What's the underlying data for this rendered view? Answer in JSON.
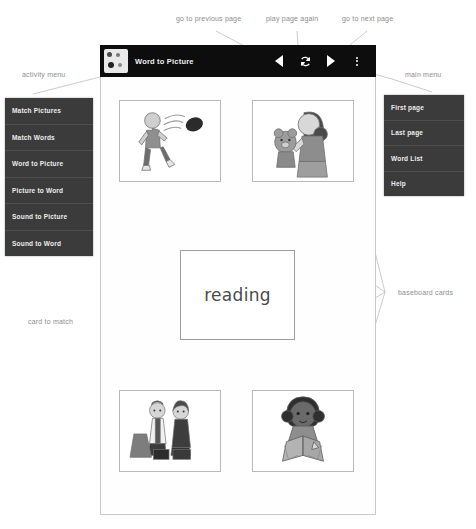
{
  "toolbar": {
    "app_icon": "app-grid-icon",
    "title": "Word to Picture",
    "prev_icon": "triangle-left-icon",
    "replay_icon": "refresh-loop-icon",
    "next_icon": "triangle-right-icon",
    "overflow_icon": "kebab-menu-icon"
  },
  "annotations": {
    "prev": "go to previous page",
    "replay": "play page again",
    "next": "go to next page",
    "activity_menu": "activity menu",
    "main_menu": "main menu",
    "baseboard_cards": "baseboard cards",
    "card_to_match": "card to match"
  },
  "activity_menu": {
    "items": [
      {
        "label": "Match Pictures"
      },
      {
        "label": "Match Words"
      },
      {
        "label": "Word to Picture"
      },
      {
        "label": "Picture to Word"
      },
      {
        "label": "Sound to Picture"
      },
      {
        "label": "Sound to Word"
      }
    ]
  },
  "main_menu": {
    "items": [
      {
        "label": "First page"
      },
      {
        "label": "Last page"
      },
      {
        "label": "Word List"
      },
      {
        "label": "Help"
      }
    ]
  },
  "board": {
    "center_card": {
      "word": "reading"
    },
    "cards": [
      {
        "position": "top-left",
        "image": "boy-kicking-ball-illustration"
      },
      {
        "position": "top-right",
        "image": "girl-holding-teddy-bear-illustration"
      },
      {
        "position": "bottom-left",
        "image": "two-children-with-bags-illustration"
      },
      {
        "position": "bottom-right",
        "image": "girl-reading-book-illustration"
      }
    ]
  },
  "colors": {
    "toolbar_bg": "#0d0d0d",
    "menu_bg": "#3b3b3b",
    "menu_text": "#ededed",
    "annotation_text": "#8d8d8d",
    "card_border": "#b9b9b9",
    "page_bg": "#ffffff"
  }
}
